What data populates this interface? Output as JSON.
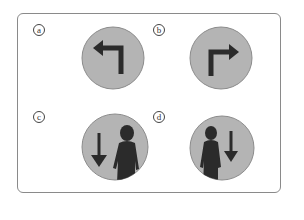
{
  "figure": {
    "options": [
      {
        "label": "a",
        "icon": "turn-left-arrow-icon",
        "description": "Left-turn arrow sign"
      },
      {
        "label": "b",
        "icon": "turn-right-arrow-icon",
        "description": "Right-turn arrow sign"
      },
      {
        "label": "c",
        "icon": "down-arrow-person-right-icon",
        "description": "Down arrow with person on right"
      },
      {
        "label": "d",
        "icon": "person-left-down-arrow-icon",
        "description": "Person on left with down arrow"
      }
    ],
    "colors": {
      "circle_fill": "#b4b4b4",
      "circle_stroke": "#8c8c8c",
      "symbol": "#2b2b2b",
      "frame": "#8a8a8a"
    }
  }
}
